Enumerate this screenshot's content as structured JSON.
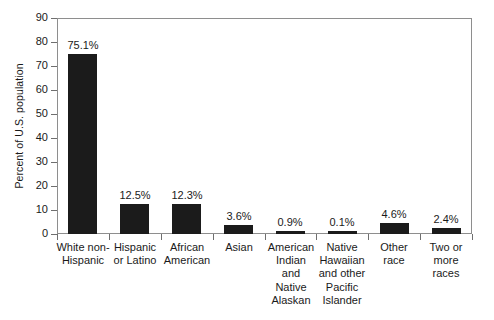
{
  "chart_data": {
    "type": "bar",
    "title": "",
    "xlabel": "",
    "ylabel": "Percent of U.S. population",
    "ylim": [
      0,
      90
    ],
    "ytick_values": [
      0,
      10,
      20,
      30,
      40,
      50,
      60,
      70,
      80,
      90
    ],
    "ytick_labels": [
      "0",
      "10",
      "20",
      "30",
      "40",
      "50",
      "60",
      "70",
      "80",
      "90"
    ],
    "grid": false,
    "legend": null,
    "bar_color": "#1b1b1b",
    "axis_color": "#8e8e8e",
    "categories": [
      "White non-Hispanic",
      "Hispanic or Latino",
      "African American",
      "Asian",
      "American Indian and Native Alaskan",
      "Native Hawaiian and other Pacific Islander",
      "Other race",
      "Two or more races"
    ],
    "category_label_lines": [
      [
        "White non-",
        "Hispanic"
      ],
      [
        "Hispanic",
        "or Latino"
      ],
      [
        "African",
        "American"
      ],
      [
        "Asian"
      ],
      [
        "American",
        "Indian",
        "and",
        "Native",
        "Alaskan"
      ],
      [
        "Native",
        "Hawaiian",
        "and other",
        "Pacific",
        "Islander"
      ],
      [
        "Other",
        "race"
      ],
      [
        "Two or",
        "more",
        "races"
      ]
    ],
    "values": [
      75.1,
      12.5,
      12.3,
      3.6,
      0.9,
      0.1,
      4.6,
      2.4
    ],
    "value_labels": [
      "75.1%",
      "12.5%",
      "12.3%",
      "3.6%",
      "0.9%",
      "0.1%",
      "4.6%",
      "2.4%"
    ]
  }
}
